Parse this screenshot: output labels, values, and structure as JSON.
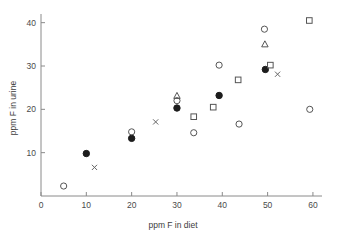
{
  "chart_data": {
    "type": "scatter",
    "title": "",
    "xlabel": "ppm F in diet",
    "ylabel": "ppm F in urine",
    "xlim": [
      0,
      62
    ],
    "ylim": [
      0,
      42
    ],
    "grid": false,
    "legend": "none",
    "xticks": [
      0,
      10,
      20,
      30,
      40,
      50,
      60
    ],
    "yticks": [
      10,
      20,
      30,
      40
    ],
    "xtick_labels": [
      "0",
      "10",
      "20",
      "30",
      "40",
      "50",
      "60"
    ],
    "ytick_labels": [
      "10",
      "20",
      "30",
      "40"
    ],
    "series": [
      {
        "name": "open-circle",
        "marker": "open-circle",
        "points": [
          [
            5.0,
            2.3
          ],
          [
            20.0,
            14.8
          ],
          [
            30.0,
            22.0
          ],
          [
            33.7,
            14.6
          ],
          [
            39.3,
            30.2
          ],
          [
            43.7,
            16.6
          ],
          [
            49.3,
            38.5
          ],
          [
            59.3,
            20.0
          ]
        ]
      },
      {
        "name": "filled-circle",
        "marker": "filled-circle",
        "points": [
          [
            10.0,
            9.8
          ],
          [
            20.0,
            13.3
          ],
          [
            30.0,
            20.3
          ],
          [
            39.3,
            23.2
          ],
          [
            49.5,
            29.2
          ]
        ]
      },
      {
        "name": "open-square",
        "marker": "open-square",
        "points": [
          [
            33.7,
            18.3
          ],
          [
            38.0,
            20.5
          ],
          [
            43.5,
            26.8
          ],
          [
            50.6,
            30.2
          ],
          [
            59.2,
            40.5
          ]
        ]
      },
      {
        "name": "open-triangle",
        "marker": "open-triangle",
        "points": [
          [
            30.0,
            23.1
          ],
          [
            49.4,
            35.0
          ]
        ]
      },
      {
        "name": "cross",
        "marker": "cross",
        "points": [
          [
            11.8,
            6.6
          ],
          [
            25.3,
            17.1
          ],
          [
            52.2,
            28.1
          ]
        ]
      }
    ]
  }
}
